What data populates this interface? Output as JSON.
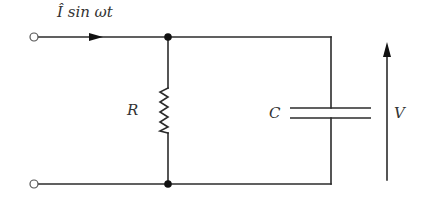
{
  "diagram": {
    "type": "parallel RC circuit",
    "labels": {
      "current": "Î sin ωt",
      "resistor": "R",
      "capacitor": "C",
      "voltage": "V"
    },
    "components": [
      {
        "id": "source-terminal-top",
        "kind": "open-terminal"
      },
      {
        "id": "source-terminal-bottom",
        "kind": "open-terminal"
      },
      {
        "id": "resistor",
        "kind": "resistor",
        "label": "R"
      },
      {
        "id": "capacitor",
        "kind": "capacitor",
        "label": "C"
      },
      {
        "id": "junction-top",
        "kind": "node"
      },
      {
        "id": "junction-bottom",
        "kind": "node"
      }
    ],
    "annotations": [
      {
        "kind": "current-arrow",
        "direction": "right",
        "label": "Î sin ωt"
      },
      {
        "kind": "voltage-arrow",
        "direction": "up",
        "label": "V"
      }
    ],
    "colors": {
      "line": "#2b2b2b",
      "text": "#333333",
      "background": "#ffffff"
    }
  }
}
